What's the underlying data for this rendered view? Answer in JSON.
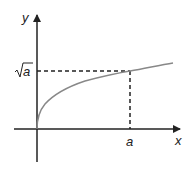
{
  "figure": {
    "axes": {
      "x_label": "x",
      "y_label": "y"
    },
    "marked_points": {
      "x_tick_label": "a",
      "y_tick_label_radicand": "a",
      "y_tick_label_symbol": "√"
    },
    "curve": {
      "function": "y = sqrt(x)",
      "color": "#888888"
    },
    "guides": {
      "style": "dashed",
      "color": "#222222"
    },
    "colors": {
      "axis": "#222222",
      "background": "#ffffff"
    }
  }
}
